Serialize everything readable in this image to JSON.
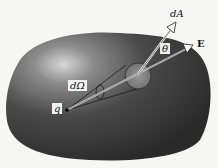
{
  "figure": {
    "labels": {
      "charge": "q",
      "solid_angle": "dΩ",
      "area_element": "dA",
      "field": "E",
      "angle": "θ"
    },
    "colors": {
      "surface_dark": "#2e2e2e",
      "surface_mid": "#5a5a5a",
      "highlight": "#d8d8d8",
      "patch": "#8a8a8a",
      "background": "#f6f6f4"
    }
  }
}
